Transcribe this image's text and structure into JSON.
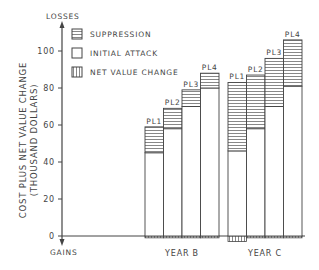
{
  "chart_data": {
    "type": "bar",
    "subtype": "stacked",
    "title": "",
    "ylabel": "COST PLUS NET VALUE CHANGE",
    "ylabel_sub": "(THOUSAND DOLLARS)",
    "top_annotation": "LOSSES",
    "bottom_annotation": "GAINS",
    "ylim": [
      -5,
      115
    ],
    "yticks": [
      0,
      20,
      40,
      60,
      80,
      100
    ],
    "ytick_labels": [
      "0",
      "20",
      "40",
      "60",
      "80",
      "100"
    ],
    "grid": false,
    "legend_position": "upper-left",
    "legend": [
      {
        "name": "SUPPRESSION",
        "pattern": "horizontal-hatch"
      },
      {
        "name": "INITIAL ATTACK",
        "pattern": "empty"
      },
      {
        "name": "NET VALUE CHANGE",
        "pattern": "vertical-hatch"
      }
    ],
    "groups": [
      {
        "label": "YEAR B",
        "bars": [
          {
            "label": "PL1",
            "initial_attack": 45,
            "suppression": 14,
            "net_value_change": -1
          },
          {
            "label": "PL2",
            "initial_attack": 58,
            "suppression": 11,
            "net_value_change": -1
          },
          {
            "label": "PL3",
            "initial_attack": 70,
            "suppression": 9,
            "net_value_change": -1
          },
          {
            "label": "PL4",
            "initial_attack": 80,
            "suppression": 8,
            "net_value_change": -1
          }
        ]
      },
      {
        "label": "YEAR C",
        "bars": [
          {
            "label": "PL1",
            "initial_attack": 46,
            "suppression": 37,
            "net_value_change": -3
          },
          {
            "label": "PL2",
            "initial_attack": 58,
            "suppression": 29,
            "net_value_change": -1
          },
          {
            "label": "PL3",
            "initial_attack": 70,
            "suppression": 26,
            "net_value_change": -1
          },
          {
            "label": "PL4",
            "initial_attack": 81,
            "suppression": 25,
            "net_value_change": -1
          }
        ]
      }
    ],
    "series": [
      {
        "name": "INITIAL ATTACK",
        "values": [
          45,
          58,
          70,
          80,
          46,
          58,
          70,
          81
        ]
      },
      {
        "name": "SUPPRESSION",
        "values": [
          14,
          11,
          9,
          8,
          37,
          29,
          26,
          25
        ]
      },
      {
        "name": "NET VALUE CHANGE",
        "values": [
          -1,
          -1,
          -1,
          -1,
          -3,
          -1,
          -1,
          -1
        ]
      }
    ],
    "categories": [
      "B-PL1",
      "B-PL2",
      "B-PL3",
      "B-PL4",
      "C-PL1",
      "C-PL2",
      "C-PL3",
      "C-PL4"
    ]
  }
}
